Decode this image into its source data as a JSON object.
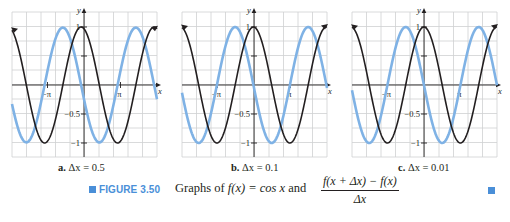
{
  "figure": {
    "number_label": "FIGURE 3.50",
    "caption_prefix": "Graphs of",
    "caption_func": "f(x) = cos x",
    "caption_and": "and",
    "fraction_numerator": "f(x + Δx) − f(x)",
    "fraction_denominator": "Δx",
    "accent_color": "#4a8fd8"
  },
  "panels": [
    {
      "letter": "a.",
      "label": "Δx = 0.5",
      "delta": 0.5
    },
    {
      "letter": "b.",
      "label": "Δx = 0.1",
      "delta": 0.1
    },
    {
      "letter": "c.",
      "label": "Δx = 0.01",
      "delta": 0.01
    }
  ],
  "axes": {
    "x_label": "x",
    "y_label": "y",
    "x_ticks": [
      "−π",
      "π"
    ],
    "y_ticks": [
      "1",
      "−0.5",
      "−1"
    ]
  },
  "chart_data": [
    {
      "type": "line",
      "title": "a. Δx = 0.5",
      "xlabel": "x",
      "ylabel": "y",
      "xlim": [
        -6.3,
        6.3
      ],
      "ylim": [
        -1.2,
        1.3
      ],
      "grid": true,
      "x_tick_labels": [
        "−π",
        "π"
      ],
      "y_tick_labels": [
        "1",
        "−0.5",
        "−1"
      ],
      "series": [
        {
          "name": "f(x) = cos x",
          "color": "#231f20",
          "function": "cos(x)"
        },
        {
          "name": "(f(x+Δx) − f(x))/Δx",
          "color": "#7fb2e5",
          "function": "(cos(x+0.5)-cos(x))/0.5"
        }
      ]
    },
    {
      "type": "line",
      "title": "b. Δx = 0.1",
      "xlabel": "x",
      "ylabel": "y",
      "xlim": [
        -6.3,
        6.3
      ],
      "ylim": [
        -1.2,
        1.3
      ],
      "grid": true,
      "x_tick_labels": [
        "−π",
        "π"
      ],
      "y_tick_labels": [
        "1",
        "−0.5",
        "−1"
      ],
      "series": [
        {
          "name": "f(x) = cos x",
          "color": "#231f20",
          "function": "cos(x)"
        },
        {
          "name": "(f(x+Δx) − f(x))/Δx",
          "color": "#7fb2e5",
          "function": "(cos(x+0.1)-cos(x))/0.1"
        }
      ]
    },
    {
      "type": "line",
      "title": "c. Δx = 0.01",
      "xlabel": "x",
      "ylabel": "y",
      "xlim": [
        -6.3,
        6.3
      ],
      "ylim": [
        -1.2,
        1.3
      ],
      "grid": true,
      "x_tick_labels": [
        "−π",
        "π"
      ],
      "y_tick_labels": [
        "1",
        "−0.5",
        "−1"
      ],
      "series": [
        {
          "name": "f(x) = cos x",
          "color": "#231f20",
          "function": "cos(x)"
        },
        {
          "name": "(f(x+Δx) − f(x))/Δx",
          "color": "#7fb2e5",
          "function": "(cos(x+0.01)-cos(x))/0.01"
        }
      ]
    }
  ]
}
